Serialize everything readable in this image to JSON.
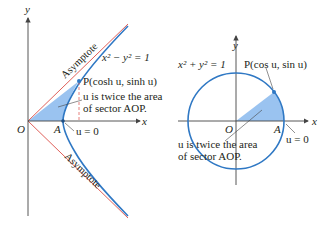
{
  "colors": {
    "curve": "#2f78c4",
    "fill": "#8fbdee",
    "asymptote": "#e0605a",
    "axis": "#444444",
    "text": "#231f20"
  },
  "left_panel": {
    "axis_y_label": "y",
    "axis_x_label": "x",
    "equation": "x² − y² = 1",
    "asymptote_upper": "Asymptote",
    "asymptote_lower": "Asymptote",
    "point_p": "P(cosh u, sinh u)",
    "note_line1": "u is twice the area",
    "note_line2": "of sector AOP.",
    "origin_label": "O",
    "point_a_label": "A",
    "u_zero": "u = 0"
  },
  "right_panel": {
    "axis_y_label": "y",
    "axis_x_label": "x",
    "equation": "x² + y² = 1",
    "point_p": "P(cos u, sin u)",
    "note_line1": "u is twice the area",
    "note_line2": "of sector AOP.",
    "origin_label": "O",
    "point_a_label": "A",
    "u_zero": "u = 0"
  }
}
